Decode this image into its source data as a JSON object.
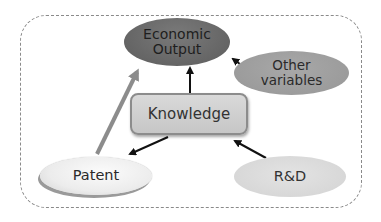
{
  "diagram": {
    "type": "flow",
    "nodes": [
      {
        "id": "economic_output",
        "label_line1": "Economic",
        "label_line2": "Output",
        "shape": "ellipse",
        "fill": "#656565"
      },
      {
        "id": "other_variables",
        "label_line1": "Other",
        "label_line2": "variables",
        "shape": "ellipse",
        "fill": "#9e9e9e"
      },
      {
        "id": "knowledge",
        "label": "Knowledge",
        "shape": "rounded-rect",
        "fill": "#cfcfcf"
      },
      {
        "id": "patent",
        "label": "Patent",
        "shape": "ellipse",
        "fill": "#f0f0f0"
      },
      {
        "id": "rnd",
        "label": "R&D",
        "shape": "ellipse",
        "fill": "#d9d9d9"
      }
    ],
    "edges": [
      {
        "from": "knowledge",
        "to": "economic_output",
        "color": "#111111"
      },
      {
        "from": "other_variables",
        "to": "economic_output",
        "color": "#111111"
      },
      {
        "from": "knowledge",
        "to": "patent",
        "color": "#111111"
      },
      {
        "from": "rnd",
        "to": "knowledge",
        "color": "#111111"
      },
      {
        "from": "patent",
        "to": "economic_output",
        "color": "#8c8c8c",
        "style": "thick"
      }
    ],
    "frame": {
      "style": "dashed",
      "color": "#8a8a8a"
    }
  }
}
